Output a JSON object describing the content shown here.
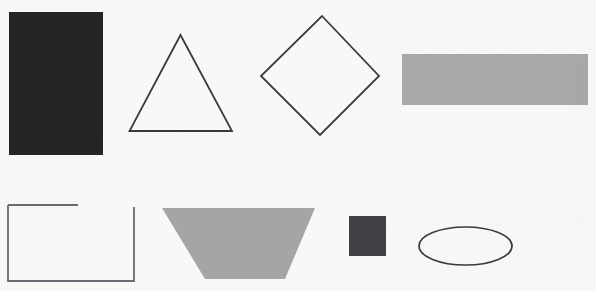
{
  "canvas": {
    "width": 596,
    "height": 291,
    "background_color": "#f8f8f7",
    "description": "Scanned sheet of hand-drawn and filled geometric shapes arranged in two rows"
  },
  "palette": {
    "paper": "#f8f8f7",
    "ink_outline": "#3b3b3f",
    "dark_fill": "#262628",
    "dark_square_fill": "#414146",
    "gray_fill": "#a9a9a9",
    "trapezoid_fill": "#a5a5a5"
  },
  "rows": [
    {
      "row_label": "top-row",
      "shape_count": 4
    },
    {
      "row_label": "bottom-row",
      "shape_count": 4
    }
  ],
  "shapes": [
    {
      "id": "filled-dark-rectangle",
      "label": "Filled dark rectangle",
      "kind": "rectangle",
      "row": "top-row",
      "style": "filled",
      "fill": "#262628",
      "stroke": "none",
      "stroke_width": 0,
      "x": 9,
      "y": 12,
      "width": 94,
      "height": 143,
      "points": "9,12 103,12 103,155 9,155"
    },
    {
      "id": "outlined-triangle",
      "label": "Outlined triangle",
      "kind": "triangle",
      "row": "top-row",
      "style": "outlined",
      "fill": "none",
      "stroke": "#3b3b3f",
      "stroke_width": 1.8,
      "points": "180.5,35 232,131 129.5,131",
      "apex_x": 180.5,
      "apex_y": 35,
      "base_y": 131,
      "base_left_x": 129.5,
      "base_right_x": 232
    },
    {
      "id": "outlined-diamond",
      "label": "Outlined diamond",
      "kind": "diamond",
      "row": "top-row",
      "style": "outlined",
      "fill": "none",
      "stroke": "#3b3b3f",
      "stroke_width": 1.8,
      "points": "322,16 379,76 320,135 261,76",
      "center_x": 320,
      "center_y": 76
    },
    {
      "id": "filled-gray-bar",
      "label": "Filled gray horizontal bar",
      "kind": "rectangle",
      "row": "top-row",
      "style": "filled",
      "fill": "#a9a9a9",
      "stroke": "none",
      "stroke_width": 0,
      "x": 402,
      "y": 54,
      "width": 186,
      "height": 51,
      "points": "402,54 588,54 588,105 402,105"
    },
    {
      "id": "open-rectangle-outline",
      "label": "Outlined rectangle with gap in top edge",
      "kind": "rectangle-open",
      "row": "bottom-row",
      "style": "outlined",
      "fill": "none",
      "stroke": "#6a6a70",
      "stroke_width": 1.8,
      "x": 8,
      "y": 205,
      "width": 126,
      "height": 76,
      "gap_edge": "top",
      "top_edge_from_x": 8,
      "top_edge_to_x": 78,
      "right_edge_from_y": 207,
      "right_edge_to_y": 281,
      "bottom_edge_y": 281
    },
    {
      "id": "filled-gray-trapezoid",
      "label": "Filled gray inverted trapezoid",
      "kind": "trapezoid",
      "row": "bottom-row",
      "style": "filled",
      "fill": "#a5a5a5",
      "stroke": "none",
      "stroke_width": 0,
      "points": "162,208 315,208 285,279 205,279",
      "top_width": 153,
      "bottom_width": 80,
      "height": 71
    },
    {
      "id": "filled-dark-square",
      "label": "Small filled dark square",
      "kind": "square",
      "row": "bottom-row",
      "style": "filled",
      "fill": "#414146",
      "stroke": "none",
      "stroke_width": 0,
      "x": 349,
      "y": 216,
      "width": 37,
      "height": 40,
      "points": "349,216 386,216 386,256 349,256"
    },
    {
      "id": "outlined-ellipse",
      "label": "Outlined ellipse",
      "kind": "ellipse",
      "row": "bottom-row",
      "style": "outlined",
      "fill": "none",
      "stroke": "#3b3b3f",
      "stroke_width": 1.7,
      "center_x": 465.5,
      "center_y": 246,
      "radius_x": 46.5,
      "radius_y": 19
    }
  ]
}
